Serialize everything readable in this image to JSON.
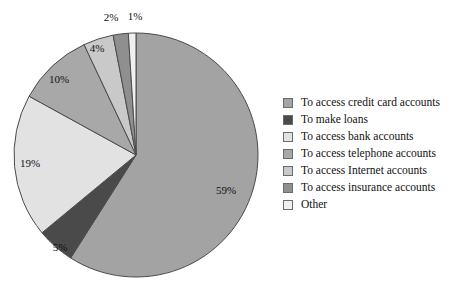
{
  "chart_data": {
    "type": "pie",
    "title": "",
    "categories": [
      "To access credit card accounts",
      "To make loans",
      "To access bank accounts",
      "To access telephone accounts",
      "To access Internet accounts",
      "To access insurance accounts",
      "Other"
    ],
    "values": [
      59,
      5,
      19,
      10,
      4,
      2,
      1
    ],
    "value_labels": [
      "59%",
      "5%",
      "19%",
      "10%",
      "4%",
      "2%",
      "1%"
    ],
    "colors": [
      "#a3a3a3",
      "#4a4a4a",
      "#e2e2e2",
      "#a8a8a8",
      "#c9c9c9",
      "#8f8f8f",
      "#f0f0f0"
    ],
    "legend_position": "right",
    "start_angle_deg": 0,
    "direction": "clockwise",
    "grid": false,
    "xlabel": "",
    "ylabel": ""
  },
  "pie": {
    "center_x": 136,
    "center_y": 155,
    "radius": 122,
    "slice_border_color": "#4b4b4b",
    "labels": [
      {
        "text": "59%",
        "x": 226,
        "y": 190
      },
      {
        "text": "5%",
        "x": 60,
        "y": 247
      },
      {
        "text": "19%",
        "x": 30,
        "y": 163
      },
      {
        "text": "10%",
        "x": 59,
        "y": 79
      },
      {
        "text": "4%",
        "x": 97,
        "y": 48
      },
      {
        "text": "2%",
        "x": 111,
        "y": 17
      },
      {
        "text": "1%",
        "x": 135,
        "y": 16
      }
    ]
  },
  "legend": {
    "items": [
      {
        "label": "To access credit card accounts",
        "color": "#a3a3a3"
      },
      {
        "label": "To make loans",
        "color": "#4a4a4a"
      },
      {
        "label": "To access bank accounts",
        "color": "#e2e2e2"
      },
      {
        "label": "To access telephone accounts",
        "color": "#a8a8a8"
      },
      {
        "label": "To access Internet accounts",
        "color": "#c9c9c9"
      },
      {
        "label": "To access insurance accounts",
        "color": "#8f8f8f"
      },
      {
        "label": "Other",
        "color": "#f0f0f0"
      }
    ]
  }
}
